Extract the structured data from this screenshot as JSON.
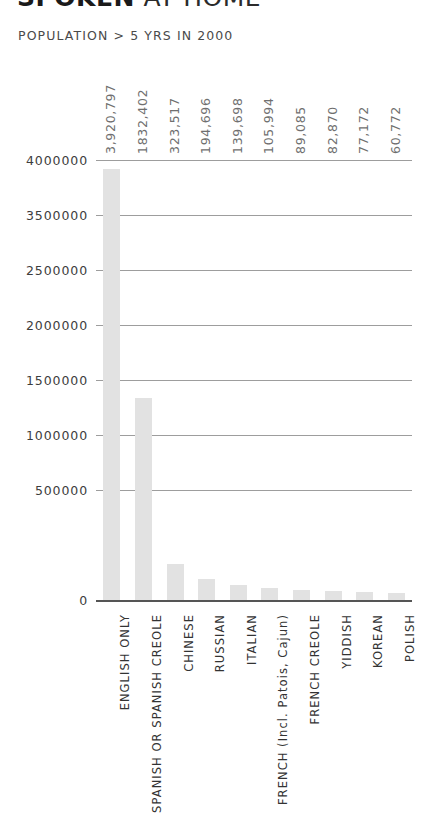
{
  "header": {
    "title_strong": "SPOKEN",
    "title_light": " AT HOME",
    "subtitle": "POPULATION > 5 YRS IN 2000"
  },
  "chart_data": {
    "type": "bar",
    "title": "SPOKEN AT HOME",
    "subtitle": "POPULATION > 5 YRS IN 2000",
    "xlabel": "",
    "ylabel": "",
    "ylim": [
      0,
      4000000
    ],
    "grid": true,
    "legend": false,
    "bar_color": "#e2e2e2",
    "categories": [
      "ENGLISH ONLY",
      "SPANISH OR SPANISH CREOLE",
      "CHINESE",
      "RUSSIAN",
      "ITALIAN",
      "FRENCH (Incl. Patois, Cajun)",
      "FRENCH CREOLE",
      "YIDDISH",
      "KOREAN",
      "POLISH"
    ],
    "values": [
      3920797,
      1832402,
      323517,
      194696,
      139698,
      105994,
      89085,
      82870,
      77172,
      60772
    ],
    "value_labels": [
      "3,920,797",
      "1832,402",
      "323,517",
      "194,696",
      "139,698",
      "105,994",
      "89,085",
      "82,870",
      "77,172",
      "60,772"
    ],
    "ytick_labels": [
      "4000000",
      "3500000",
      "2500000",
      "2000000",
      "1500000",
      "1000000",
      "500000",
      "0"
    ],
    "ytick_positions": [
      4000000,
      3500000,
      3000000,
      2500000,
      2000000,
      1500000,
      1000000,
      0
    ]
  }
}
